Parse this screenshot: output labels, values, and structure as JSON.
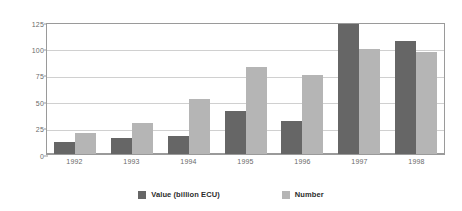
{
  "chart_data": {
    "type": "bar",
    "title": "",
    "subtitle": "",
    "xlabel": "",
    "ylabel": "",
    "categories": [
      "1992",
      "1993",
      "1994",
      "1995",
      "1996",
      "1997",
      "1998"
    ],
    "series": [
      {
        "name": "Value (billion ECU)",
        "color": "#666666",
        "values": [
          11,
          15,
          17,
          41,
          31,
          123,
          107
        ]
      },
      {
        "name": "Number",
        "color": "#b5b5b5",
        "values": [
          20,
          29,
          52,
          82,
          75,
          99,
          97
        ]
      }
    ],
    "ylim": [
      0,
      125
    ],
    "yticks": [
      0,
      25,
      50,
      75,
      100,
      125
    ],
    "ytick_labels": [
      "0",
      "25",
      "50",
      "75",
      "100",
      "125"
    ],
    "grid": true,
    "grid_axis": "y",
    "legend_position": "bottom",
    "background": "#ffffff"
  },
  "legend": {
    "items": [
      {
        "label": "Value (billion ECU)",
        "swatch": "value"
      },
      {
        "label": "Number",
        "swatch": "number"
      }
    ]
  },
  "colors": {
    "series_value": "#666666",
    "series_number": "#b5b5b5",
    "gridline": "#d0d0d0",
    "axis": "#9a9a9a",
    "tick_text": "#6a6a6a",
    "legend_text": "#2b2b2b",
    "background": "#ffffff"
  }
}
